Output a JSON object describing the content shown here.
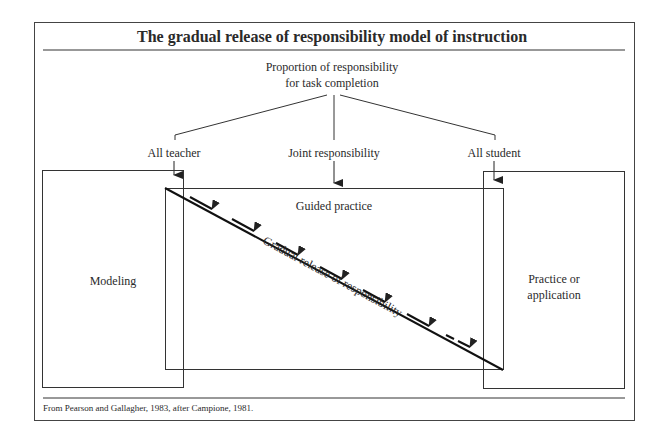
{
  "title": "The gradual release of responsibility model of instruction",
  "top_label": {
    "line1": "Proportion of responsibility",
    "line2": "for task completion"
  },
  "branches": [
    {
      "label": "All teacher"
    },
    {
      "label": "Joint responsibility"
    },
    {
      "label": "All student"
    }
  ],
  "boxes": {
    "modeling": "Modeling",
    "guided": "Guided practice",
    "practice_line1": "Practice or",
    "practice_line2": "application"
  },
  "diagonal_label": "Gradual release of responsibility",
  "footer": "From Pearson and Gallagher, 1983, after Campione, 1981.",
  "colors": {
    "stroke": "#333333",
    "text": "#2a2a2a",
    "background": "#ffffff"
  }
}
